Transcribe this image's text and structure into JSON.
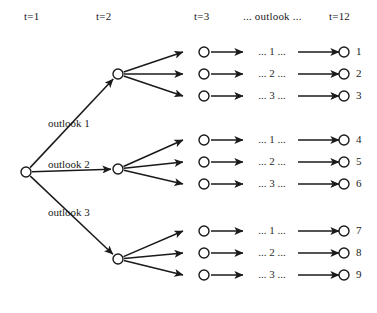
{
  "figure": {
    "type": "diagram",
    "subtype": "scenario-tree",
    "background": "#ffffff",
    "stroke_color": "#1a1a1a",
    "node_fill": "#ffffff",
    "width": 377,
    "height": 313
  },
  "headers": [
    {
      "label": "t=1",
      "x": 24,
      "y": 10
    },
    {
      "label": "t=2",
      "x": 96,
      "y": 10
    },
    {
      "label": "t=3",
      "x": 194,
      "y": 10
    },
    {
      "label": "... outlook ...",
      "x": 243,
      "y": 10
    },
    {
      "label": "t=12",
      "x": 329,
      "y": 10
    }
  ],
  "stage1": {
    "root": {
      "name": "root-node",
      "x": 26,
      "y": 172
    }
  },
  "stage2": {
    "nodes": [
      {
        "name": "stage2-node-1",
        "x": 118,
        "y": 74
      },
      {
        "name": "stage2-node-2",
        "x": 118,
        "y": 169
      },
      {
        "name": "stage2-node-3",
        "x": 118,
        "y": 259
      }
    ],
    "edge_labels": [
      {
        "label": "outlook 1",
        "x": 48,
        "y": 117
      },
      {
        "label": "outlook 2",
        "x": 48,
        "y": 158
      },
      {
        "label": "outlook 3",
        "x": 48,
        "y": 206
      }
    ]
  },
  "stage3": {
    "nodes": [
      {
        "name": "stage3-node-1",
        "x": 204,
        "y": 52
      },
      {
        "name": "stage3-node-2",
        "x": 204,
        "y": 74
      },
      {
        "name": "stage3-node-3",
        "x": 204,
        "y": 96
      },
      {
        "name": "stage3-node-4",
        "x": 204,
        "y": 140
      },
      {
        "name": "stage3-node-5",
        "x": 204,
        "y": 162
      },
      {
        "name": "stage3-node-6",
        "x": 204,
        "y": 184
      },
      {
        "name": "stage3-node-7",
        "x": 204,
        "y": 231
      },
      {
        "name": "stage3-node-8",
        "x": 204,
        "y": 253
      },
      {
        "name": "stage3-node-9",
        "x": 204,
        "y": 275
      }
    ]
  },
  "middle_labels": [
    {
      "label": "... 1 ...",
      "y": 52
    },
    {
      "label": "... 2 ...",
      "y": 74
    },
    {
      "label": "... 3 ...",
      "y": 96
    },
    {
      "label": "... 1 ...",
      "y": 140
    },
    {
      "label": "... 2 ...",
      "y": 162
    },
    {
      "label": "... 3 ...",
      "y": 184
    },
    {
      "label": "... 1 ...",
      "y": 231
    },
    {
      "label": "... 2 ...",
      "y": 253
    },
    {
      "label": "... 3 ...",
      "y": 275
    }
  ],
  "leaves": [
    {
      "name": "leaf-node-1",
      "label": "1",
      "x": 344,
      "y": 52
    },
    {
      "name": "leaf-node-2",
      "label": "2",
      "x": 344,
      "y": 74
    },
    {
      "name": "leaf-node-3",
      "label": "3",
      "x": 344,
      "y": 96
    },
    {
      "name": "leaf-node-4",
      "label": "4",
      "x": 344,
      "y": 140
    },
    {
      "name": "leaf-node-5",
      "label": "5",
      "x": 344,
      "y": 162
    },
    {
      "name": "leaf-node-6",
      "label": "6",
      "x": 344,
      "y": 184
    },
    {
      "name": "leaf-node-7",
      "label": "7",
      "x": 344,
      "y": 231
    },
    {
      "name": "leaf-node-8",
      "label": "8",
      "x": 344,
      "y": 253
    },
    {
      "name": "leaf-node-9",
      "label": "9",
      "x": 344,
      "y": 275
    }
  ],
  "geometry": {
    "node_radius": 5,
    "stage3_arrow_tail_x": 183,
    "stage3_out_tail_x": 211,
    "stage3_out_head_x": 243,
    "leaf_tail_x": 298,
    "leaf_head_x": 339,
    "mid_label_x": 248,
    "mid_label_w": 48
  }
}
